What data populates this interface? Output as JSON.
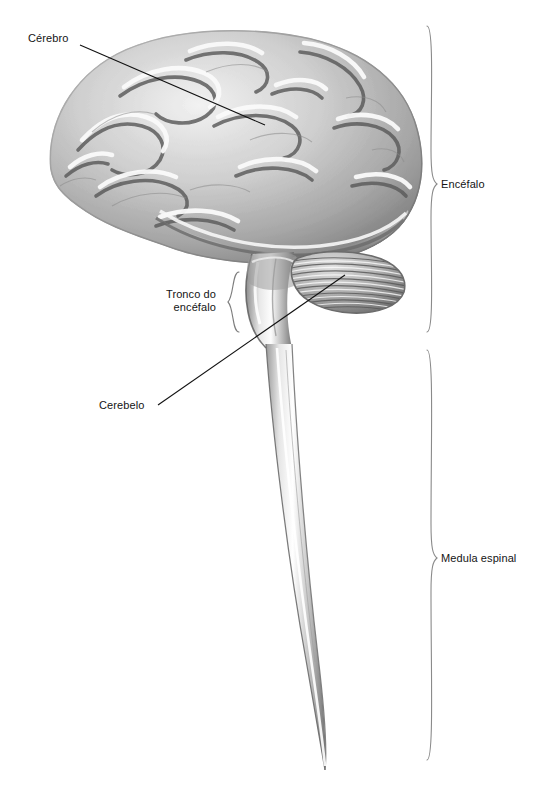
{
  "figure": {
    "background_color": "#ffffff",
    "ink_color": "#141414",
    "illustration_style": "grayscale-engraving"
  },
  "labels": {
    "cerebro": "Cérebro",
    "tronco_line1": "Tronco do",
    "tronco_line2": "encéfalo",
    "cerebelo": "Cerebelo",
    "encefalo": "Encéfalo",
    "medula_espinal": "Medula espinal"
  },
  "structures": [
    {
      "name": "cerebrum",
      "label": "Cérebro"
    },
    {
      "name": "brainstem",
      "label": "Tronco do encéfalo"
    },
    {
      "name": "cerebellum",
      "label": "Cerebelo"
    },
    {
      "name": "brain",
      "label": "Encéfalo"
    },
    {
      "name": "spinal-cord",
      "label": "Medula espinal"
    }
  ]
}
